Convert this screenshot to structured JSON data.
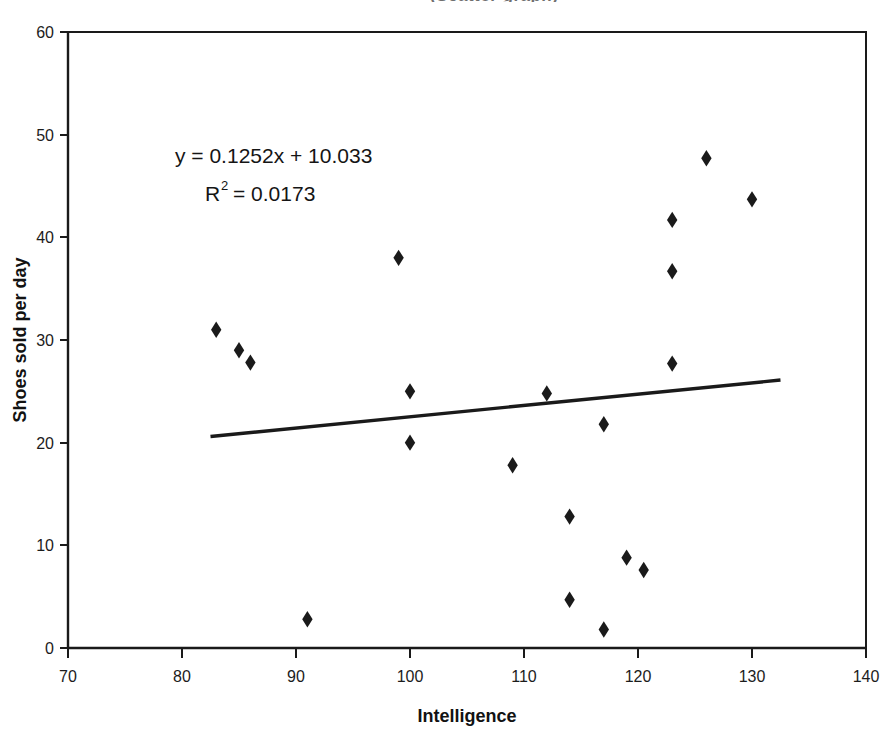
{
  "figure": {
    "cropped_top_title": "(Scatter graph)",
    "background_color": "#ffffff",
    "ink_color": "#1a1a1a"
  },
  "chart_data": {
    "type": "scatter",
    "title": "",
    "xlabel": "Intelligence",
    "ylabel": "Shoes sold per day",
    "xlim": [
      70,
      140
    ],
    "ylim": [
      0,
      60
    ],
    "xticks": [
      70,
      80,
      90,
      100,
      110,
      120,
      130,
      140
    ],
    "yticks": [
      0,
      10,
      20,
      30,
      40,
      50,
      60
    ],
    "grid": false,
    "legend": false,
    "marker": "diamond",
    "marker_color": "#1a1a1a",
    "points": [
      {
        "x": 83,
        "y": 31.0
      },
      {
        "x": 85,
        "y": 29.0
      },
      {
        "x": 86,
        "y": 27.8
      },
      {
        "x": 91,
        "y": 2.8
      },
      {
        "x": 99,
        "y": 38.0
      },
      {
        "x": 100,
        "y": 25.0
      },
      {
        "x": 100,
        "y": 20.0
      },
      {
        "x": 109,
        "y": 17.8
      },
      {
        "x": 112,
        "y": 24.8
      },
      {
        "x": 114,
        "y": 12.8
      },
      {
        "x": 114,
        "y": 4.7
      },
      {
        "x": 117,
        "y": 1.8
      },
      {
        "x": 117,
        "y": 21.8
      },
      {
        "x": 119,
        "y": 8.8
      },
      {
        "x": 120.5,
        "y": 7.6
      },
      {
        "x": 123,
        "y": 41.7
      },
      {
        "x": 123,
        "y": 36.7
      },
      {
        "x": 123,
        "y": 27.7
      },
      {
        "x": 126,
        "y": 47.7
      },
      {
        "x": 130,
        "y": 43.7
      }
    ],
    "trendline": {
      "equation_label": "y = 0.1252x + 10.033",
      "r_squared_label_prefix": "R",
      "r_squared_label_sup": "2",
      "r_squared_label_value": "= 0.0173",
      "slope": 0.1252,
      "intercept": 10.033,
      "r_squared": 0.0173,
      "x_start": 82.5,
      "x_end": 132.5,
      "y_start": 20.6,
      "y_end": 26.1,
      "color": "#1a1a1a"
    }
  }
}
